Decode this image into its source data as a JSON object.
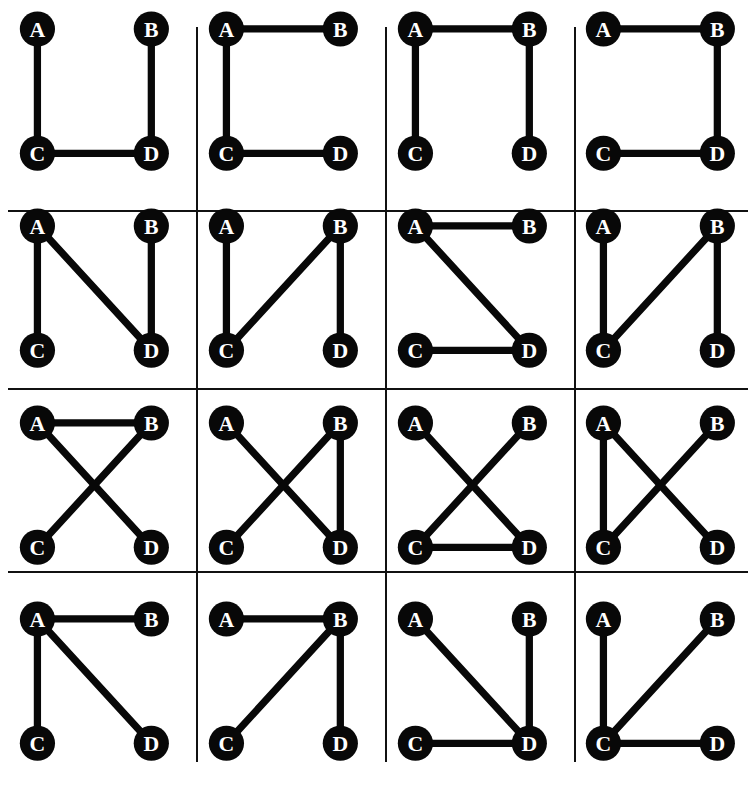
{
  "figure": {
    "title": "",
    "type": "graph-grid",
    "rows": 4,
    "columns": 4,
    "node_labels": [
      "A",
      "B",
      "C",
      "D"
    ],
    "node_positions": {
      "A": {
        "x": 34,
        "y": 28
      },
      "B": {
        "x": 144,
        "y": 28
      },
      "C": {
        "x": 34,
        "y": 148
      },
      "D": {
        "x": 144,
        "y": 148
      }
    },
    "colors": {
      "node_fill": "#080808",
      "node_text": "#ffffff",
      "edge": "#080808",
      "grid_line": "#111111",
      "background": "#ffffff"
    },
    "node_radius": 17,
    "edge_width": 7
  },
  "graphs": [
    {
      "index": 1,
      "edges": [
        [
          "A",
          "C"
        ],
        [
          "B",
          "D"
        ],
        [
          "C",
          "D"
        ]
      ]
    },
    {
      "index": 2,
      "edges": [
        [
          "A",
          "B"
        ],
        [
          "A",
          "C"
        ],
        [
          "C",
          "D"
        ]
      ]
    },
    {
      "index": 3,
      "edges": [
        [
          "A",
          "B"
        ],
        [
          "A",
          "C"
        ],
        [
          "B",
          "D"
        ]
      ]
    },
    {
      "index": 4,
      "edges": [
        [
          "A",
          "B"
        ],
        [
          "B",
          "D"
        ],
        [
          "C",
          "D"
        ]
      ]
    },
    {
      "index": 5,
      "edges": [
        [
          "A",
          "C"
        ],
        [
          "A",
          "D"
        ],
        [
          "B",
          "D"
        ]
      ]
    },
    {
      "index": 6,
      "edges": [
        [
          "A",
          "C"
        ],
        [
          "B",
          "C"
        ],
        [
          "B",
          "D"
        ]
      ]
    },
    {
      "index": 7,
      "edges": [
        [
          "A",
          "B"
        ],
        [
          "A",
          "D"
        ],
        [
          "C",
          "D"
        ]
      ]
    },
    {
      "index": 8,
      "edges": [
        [
          "A",
          "C"
        ],
        [
          "B",
          "C"
        ],
        [
          "B",
          "D"
        ]
      ]
    },
    {
      "index": 9,
      "edges": [
        [
          "A",
          "B"
        ],
        [
          "A",
          "D"
        ],
        [
          "B",
          "C"
        ]
      ]
    },
    {
      "index": 10,
      "edges": [
        [
          "A",
          "D"
        ],
        [
          "B",
          "C"
        ],
        [
          "B",
          "D"
        ]
      ]
    },
    {
      "index": 11,
      "edges": [
        [
          "A",
          "D"
        ],
        [
          "B",
          "C"
        ],
        [
          "C",
          "D"
        ]
      ]
    },
    {
      "index": 12,
      "edges": [
        [
          "A",
          "C"
        ],
        [
          "A",
          "D"
        ],
        [
          "B",
          "C"
        ]
      ]
    },
    {
      "index": 13,
      "edges": [
        [
          "A",
          "B"
        ],
        [
          "A",
          "C"
        ],
        [
          "A",
          "D"
        ]
      ]
    },
    {
      "index": 14,
      "edges": [
        [
          "A",
          "B"
        ],
        [
          "B",
          "C"
        ],
        [
          "B",
          "D"
        ]
      ]
    },
    {
      "index": 15,
      "edges": [
        [
          "A",
          "D"
        ],
        [
          "B",
          "D"
        ],
        [
          "C",
          "D"
        ]
      ]
    },
    {
      "index": 16,
      "edges": [
        [
          "A",
          "C"
        ],
        [
          "B",
          "C"
        ],
        [
          "C",
          "D"
        ]
      ]
    }
  ],
  "grid_lines": {
    "vertical_x": [
      196,
      385,
      574
    ],
    "horizontal_y": [
      210,
      388,
      571
    ]
  }
}
